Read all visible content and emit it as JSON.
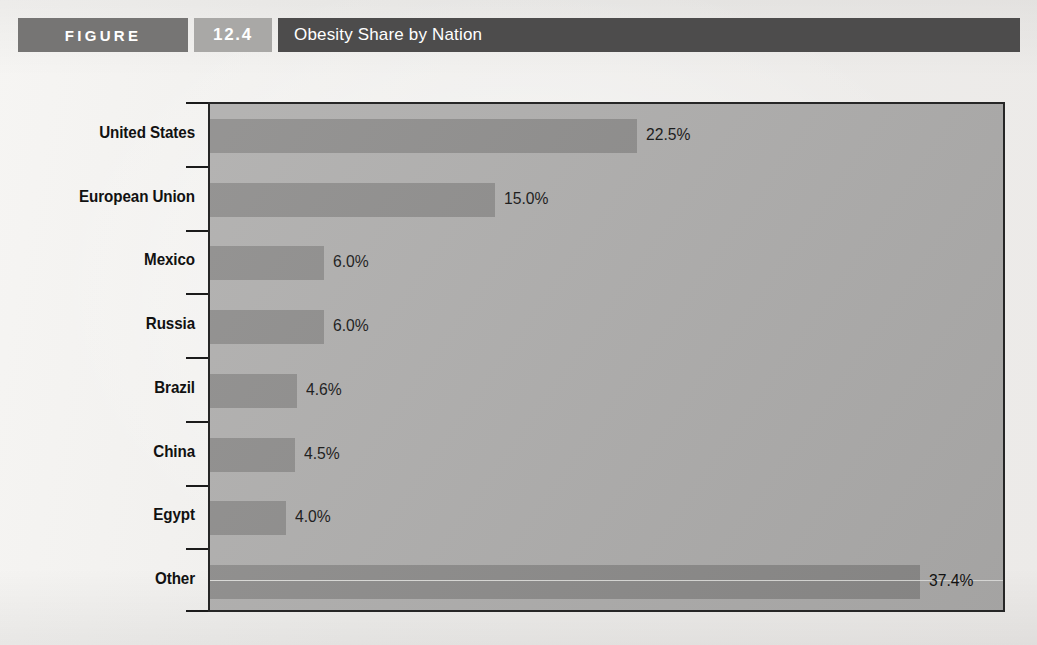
{
  "header": {
    "figure_label": "FIGURE",
    "figure_number": "12.4",
    "title": "Obesity Share by Nation",
    "colors": {
      "figure_block": "#767574",
      "number_block": "#a9a8a6",
      "title_block": "#4d4c4c",
      "title_text": "#ffffff"
    }
  },
  "chart_data": {
    "type": "bar",
    "orientation": "horizontal",
    "title": "Obesity Share by Nation",
    "xlabel": "",
    "ylabel": "",
    "xlim": [
      0,
      42
    ],
    "grid": false,
    "legend": null,
    "value_suffix": "%",
    "categories": [
      "United States",
      "European Union",
      "Mexico",
      "Russia",
      "Brazil",
      "China",
      "Egypt",
      "Other"
    ],
    "values": [
      22.5,
      15.0,
      6.0,
      6.0,
      4.6,
      4.5,
      4.0,
      37.4
    ],
    "data_labels": [
      "22.5%",
      "15.0%",
      "6.0%",
      "6.0%",
      "4.6%",
      "4.5%",
      "4.0%",
      "37.4%"
    ],
    "colors": {
      "plot_background": "#adacab",
      "bar_fill": "#8b8a89",
      "axis": "#262626",
      "label_text": "#111111"
    }
  }
}
